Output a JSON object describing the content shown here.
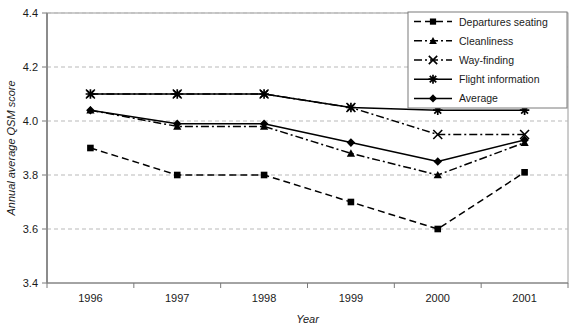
{
  "chart_data": {
    "type": "line",
    "title": "",
    "xlabel": "Year",
    "ylabel": "Annual average QSM score",
    "categories": [
      "1996",
      "1997",
      "1998",
      "1999",
      "2000",
      "2001"
    ],
    "ylim": [
      3.4,
      4.4
    ],
    "yticks": [
      "3.4",
      "3.6",
      "3.8",
      "4.0",
      "4.2",
      "4.4"
    ],
    "ytick_values": [
      3.4,
      3.6,
      3.8,
      4.0,
      4.2,
      4.4
    ],
    "grid": true,
    "grid_axis": "y",
    "legend_position": "top-right",
    "series": [
      {
        "name": "Departures seating",
        "marker": "square",
        "line_style": "dashed",
        "color": "#000000",
        "values": [
          3.9,
          3.8,
          3.8,
          3.7,
          3.6,
          3.81
        ]
      },
      {
        "name": "Cleanliness",
        "marker": "triangle",
        "line_style": "dash-dot",
        "color": "#000000",
        "values": [
          4.04,
          3.98,
          3.98,
          3.88,
          3.8,
          3.92
        ]
      },
      {
        "name": "Way-finding",
        "marker": "x",
        "line_style": "dash-dot",
        "color": "#000000",
        "values": [
          4.1,
          4.1,
          4.1,
          4.05,
          3.95,
          3.95
        ]
      },
      {
        "name": "Flight information",
        "marker": "asterisk",
        "line_style": "solid",
        "color": "#000000",
        "values": [
          4.1,
          4.1,
          4.1,
          4.05,
          4.04,
          4.04
        ]
      },
      {
        "name": "Average",
        "marker": "diamond",
        "line_style": "solid",
        "color": "#000000",
        "values": [
          4.04,
          3.99,
          3.99,
          3.92,
          3.85,
          3.93
        ]
      }
    ]
  },
  "caption": {
    "fragment": ""
  }
}
